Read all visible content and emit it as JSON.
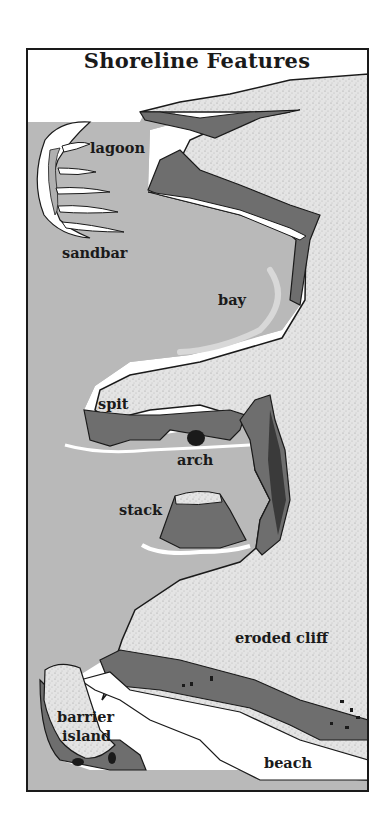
{
  "diagram": {
    "title": "Shoreline Features",
    "labels": {
      "lagoon": "lagoon",
      "sandbar": "sandbar",
      "bay": "bay",
      "spit": "spit",
      "arch": "arch",
      "stack": "stack",
      "eroded_cliff": "eroded cliff",
      "barrier_island_line1": "barrier",
      "barrier_island_line2": "island",
      "beach": "beach"
    },
    "colors": {
      "water": "#b9b9b9",
      "land": "#e2e2e2",
      "cliff": "#6e6e6e",
      "sand": "#ffffff",
      "outline": "#1a1a1a"
    }
  }
}
